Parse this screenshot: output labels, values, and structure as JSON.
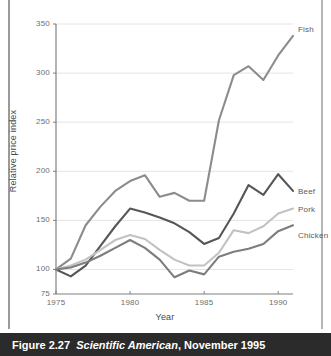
{
  "caption": {
    "figure_number": "Figure 2.27",
    "source": "Scientific American",
    "date": ", November 1995"
  },
  "chart_data": {
    "type": "line",
    "title": "",
    "xlabel": "Year",
    "ylabel": "Relative price index",
    "xlim": [
      1975,
      1991
    ],
    "ylim": [
      75,
      350
    ],
    "xticks": [
      1975,
      1980,
      1985,
      1990
    ],
    "xtick_labels": [
      "1975",
      "1980",
      "1985",
      "1990"
    ],
    "yticks": [
      75,
      100,
      150,
      200,
      250,
      300,
      350
    ],
    "ytick_labels": [
      "75",
      "100",
      "150",
      "200",
      "250",
      "300",
      "350"
    ],
    "grid": "horizontal",
    "legend_position": "right-inline",
    "x": [
      1975,
      1976,
      1977,
      1978,
      1979,
      1980,
      1981,
      1982,
      1983,
      1984,
      1985,
      1986,
      1987,
      1988,
      1989,
      1990,
      1991
    ],
    "series": [
      {
        "name": "Fish",
        "color": "#8c8c8c",
        "values": [
          100,
          111,
          145,
          164,
          180,
          190,
          196,
          174,
          178,
          170,
          170,
          252,
          298,
          307,
          293,
          318,
          338
        ]
      },
      {
        "name": "Beef",
        "color": "#565656",
        "values": [
          100,
          93,
          104,
          124,
          144,
          162,
          158,
          153,
          147,
          138,
          126,
          132,
          157,
          186,
          176,
          197,
          180
        ]
      },
      {
        "name": "Pork",
        "color": "#c2c2c2",
        "values": [
          100,
          104,
          110,
          120,
          130,
          135,
          131,
          120,
          110,
          104,
          104,
          117,
          140,
          137,
          144,
          157,
          162
        ]
      },
      {
        "name": "Chicken",
        "color": "#7d7d7d",
        "values": [
          100,
          102,
          107,
          114,
          122,
          130,
          122,
          110,
          92,
          99,
          95,
          113,
          118,
          121,
          126,
          139,
          145
        ]
      }
    ]
  }
}
